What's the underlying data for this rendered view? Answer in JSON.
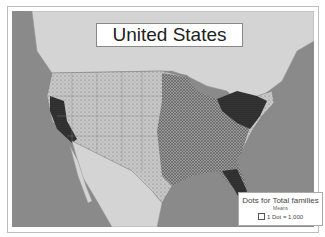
{
  "map": {
    "title": "United States",
    "colors": {
      "ocean": "#8a8a8a",
      "land_other": "#d4d4d4",
      "dense": "#2a2a2a",
      "medium": "#6a6a6a",
      "sparse": "#bcbcbc"
    }
  },
  "legend": {
    "title": "Dots for Total families",
    "subtitle": "Means",
    "item": "1 Dot = 1,000"
  }
}
